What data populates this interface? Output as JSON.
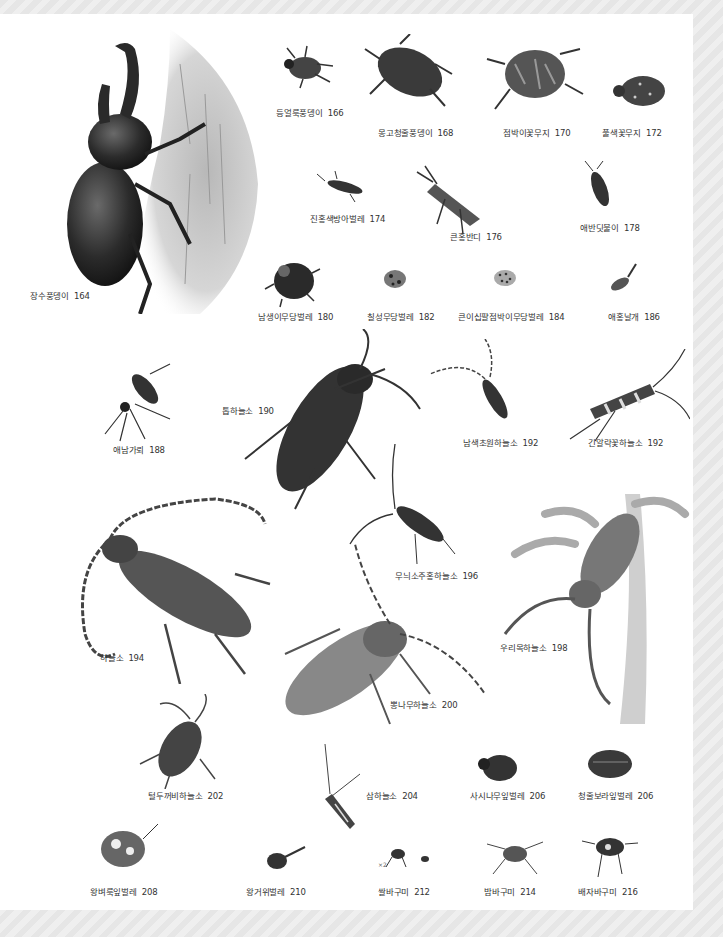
{
  "page": {
    "page_number": "",
    "palette": {
      "background": "#ececec",
      "paper": "#ffffff",
      "text": "#333333",
      "ink": "#2a2a2a"
    }
  },
  "species": [
    {
      "name": "장수풍뎅이",
      "page": "164"
    },
    {
      "name": "등얼룩풍뎅이",
      "page": "166"
    },
    {
      "name": "몽고청줄풍뎅이",
      "page": "168"
    },
    {
      "name": "점박이꽃무지",
      "page": "170"
    },
    {
      "name": "풀색꽃무지",
      "page": "172"
    },
    {
      "name": "진홍색방아벌레",
      "page": "174"
    },
    {
      "name": "큰홍반디",
      "page": "176"
    },
    {
      "name": "애반딧불이",
      "page": "178"
    },
    {
      "name": "남생이무당벌레",
      "page": "180"
    },
    {
      "name": "칠성무당벌레",
      "page": "182"
    },
    {
      "name": "큰이십팔점박이무당벌레",
      "page": "184"
    },
    {
      "name": "애홍날개",
      "page": "186"
    },
    {
      "name": "애남가뢰",
      "page": "188"
    },
    {
      "name": "톱하늘소",
      "page": "190"
    },
    {
      "name": "남색초원하늘소",
      "page": "192"
    },
    {
      "name": "긴알락꽃하늘소",
      "page": "192"
    },
    {
      "name": "하늘소",
      "page": "194"
    },
    {
      "name": "무늬소주홍하늘소",
      "page": "196"
    },
    {
      "name": "우리목하늘소",
      "page": "198"
    },
    {
      "name": "뽕나무하늘소",
      "page": "200"
    },
    {
      "name": "털두꺼비하늘소",
      "page": "202"
    },
    {
      "name": "삼하늘소",
      "page": "204"
    },
    {
      "name": "사시나무잎벌레",
      "page": "206"
    },
    {
      "name": "청줄보라잎벌레",
      "page": "206"
    },
    {
      "name": "왕벼룩잎벌레",
      "page": "208"
    },
    {
      "name": "왕거위벌레",
      "page": "210"
    },
    {
      "name": "쌀바구미",
      "page": "212"
    },
    {
      "name": "밤바구미",
      "page": "214"
    },
    {
      "name": "배자바구미",
      "page": "216"
    }
  ],
  "annotations": {
    "scale_note": "×2"
  }
}
